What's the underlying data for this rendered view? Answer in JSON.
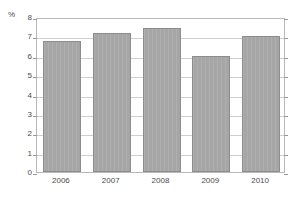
{
  "figure": {
    "clipped_title": "",
    "unit_label": "%"
  },
  "chart_data": {
    "type": "bar",
    "title": "",
    "subtitle": "",
    "xlabel": "",
    "ylabel": "%",
    "categories": [
      "2006",
      "2007",
      "2008",
      "2009",
      "2010"
    ],
    "values": [
      6.75,
      7.15,
      7.45,
      6.0,
      7.0
    ],
    "series": [
      {
        "name": "",
        "values": [
          6.75,
          7.15,
          7.45,
          6.0,
          7.0
        ]
      }
    ],
    "ylim": [
      0,
      8
    ],
    "ytick_labels": [
      "8",
      "7",
      "6",
      "5",
      "4",
      "3",
      "2",
      "1",
      "0"
    ],
    "ytick_values": [
      8,
      7,
      6,
      5,
      4,
      3,
      2,
      1,
      0
    ],
    "ytick_step": 1,
    "grid": true,
    "grid_axis": "y",
    "legend": false,
    "legend_position": "none",
    "annotations": [],
    "colors": {
      "bar_fill": "#a6a6a6",
      "bar_border": "#8c8c8c",
      "gridline": "#cfcfcf",
      "frame": "#b9b9b9",
      "text": "#4a4a4a",
      "background": "#ffffff"
    }
  }
}
